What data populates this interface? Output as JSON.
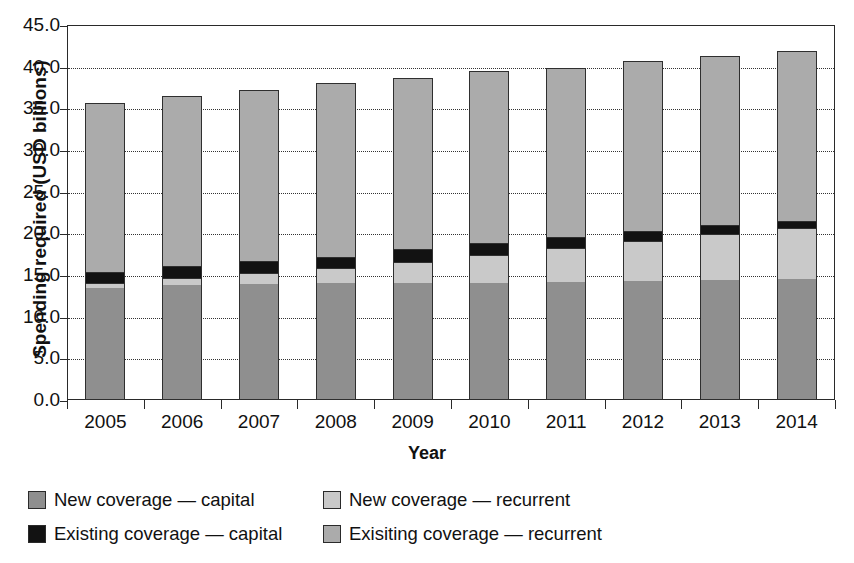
{
  "chart_data": {
    "type": "bar",
    "subtype": "stacked-vertical",
    "title": "",
    "xlabel": "Year",
    "ylabel": "Spending required (USD billions)",
    "categories": [
      "2005",
      "2006",
      "2007",
      "2008",
      "2009",
      "2010",
      "2011",
      "2012",
      "2013",
      "2014"
    ],
    "ylim": [
      0.0,
      45.0
    ],
    "y_tick_labels": [
      "0.0",
      "5.0",
      "10.0",
      "15.0",
      "20.0",
      "25.0",
      "30.0",
      "35.0",
      "40.0",
      "45.0"
    ],
    "y_tick_values": [
      0.0,
      5.0,
      10.0,
      15.0,
      20.0,
      25.0,
      30.0,
      35.0,
      40.0,
      45.0
    ],
    "grid": "horizontal-dotted",
    "legend_position": "below-plot",
    "stack_order_bottom_to_top": [
      "New coverage — capital",
      "New coverage — recurrent",
      "Existing coverage — capital",
      "Exisiting coverage — recurrent"
    ],
    "series": [
      {
        "name": "New coverage — capital",
        "color": "#8f8f8f",
        "values": [
          13.5,
          13.8,
          13.9,
          14.0,
          14.0,
          14.1,
          14.2,
          14.3,
          14.4,
          14.5
        ]
      },
      {
        "name": "New coverage — recurrent",
        "color": "#c9c9c9",
        "values": [
          0.6,
          0.8,
          1.3,
          1.8,
          2.6,
          3.3,
          4.0,
          4.8,
          5.5,
          6.1
        ]
      },
      {
        "name": "Existing coverage — capital",
        "color": "#121212",
        "values": [
          1.3,
          1.5,
          1.5,
          1.4,
          1.5,
          1.5,
          1.4,
          1.2,
          1.1,
          0.9
        ]
      },
      {
        "name": "Exisiting coverage — recurrent",
        "color": "#ababab",
        "values": [
          20.3,
          20.4,
          20.5,
          20.8,
          20.6,
          20.6,
          20.3,
          20.4,
          20.3,
          20.4
        ]
      }
    ],
    "totals": [
      35.7,
      36.5,
      37.2,
      38.0,
      38.7,
      39.5,
      39.9,
      40.7,
      41.3,
      41.9
    ]
  },
  "legend": {
    "entries": [
      {
        "label": "New coverage — capital",
        "swatch": "k0"
      },
      {
        "label": "New coverage — recurrent",
        "swatch": "k1"
      },
      {
        "label": "Existing coverage — capital",
        "swatch": "k2"
      },
      {
        "label": "Exisiting coverage — recurrent",
        "swatch": "k3"
      }
    ]
  }
}
